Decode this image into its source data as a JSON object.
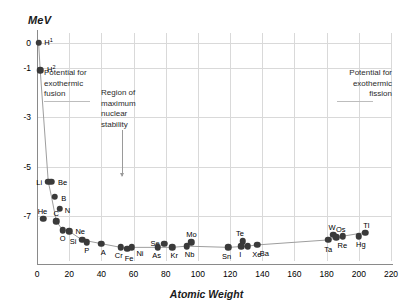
{
  "chart_data": {
    "type": "scatter",
    "title": "",
    "xlabel": "Atomic Weight",
    "ylabel": "MeV",
    "xlim": [
      0,
      220
    ],
    "ylim": [
      -8.8,
      0.4
    ],
    "grid": true,
    "legend": "none",
    "xticks": [
      0,
      20,
      40,
      60,
      80,
      100,
      120,
      140,
      160,
      180,
      200,
      220
    ],
    "yticks": [
      0,
      -1,
      -3,
      -5,
      -7
    ],
    "ytick_labels": [
      "0",
      "-1",
      "-3",
      "-5",
      "-7"
    ],
    "points": [
      {
        "label": "H",
        "sup": "1",
        "x": 1,
        "y": 0.0,
        "lx": 10,
        "ly": -1
      },
      {
        "label": "H",
        "sup": "2",
        "x": 2,
        "y": -1.1,
        "lx": 11,
        "ly": -1
      },
      {
        "label": "Li",
        "sup": "",
        "x": 7,
        "y": -5.6,
        "lx": -9,
        "ly": 0
      },
      {
        "label": "Be",
        "sup": "",
        "x": 9,
        "y": -5.6,
        "lx": 11,
        "ly": 0
      },
      {
        "label": "B",
        "sup": "",
        "x": 11,
        "y": -6.2,
        "lx": 9,
        "ly": 1
      },
      {
        "label": "He",
        "sup": "",
        "x": 4,
        "y": -7.1,
        "lx": -1,
        "ly": -8
      },
      {
        "label": "N",
        "sup": "",
        "x": 14,
        "y": -6.7,
        "lx": 8,
        "ly": 1
      },
      {
        "label": "C",
        "sup": "",
        "x": 12,
        "y": -7.2,
        "lx": 0,
        "ly": -8
      },
      {
        "label": "O",
        "sup": "",
        "x": 16,
        "y": -7.55,
        "lx": 0,
        "ly": 8
      },
      {
        "label": "Ne",
        "sup": "",
        "x": 20,
        "y": -7.6,
        "lx": 11,
        "ly": 0
      },
      {
        "label": "Si",
        "sup": "",
        "x": 28,
        "y": -7.95,
        "lx": -9,
        "ly": 1
      },
      {
        "label": "P",
        "sup": "",
        "x": 31,
        "y": -8.05,
        "lx": 0,
        "ly": 8
      },
      {
        "label": "A",
        "sup": "",
        "x": 40,
        "y": -8.1,
        "lx": 2,
        "ly": 8
      },
      {
        "label": "Cr",
        "sup": "",
        "x": 52,
        "y": -8.25,
        "lx": -2,
        "ly": 8
      },
      {
        "label": "Fe",
        "sup": "",
        "x": 56,
        "y": -8.3,
        "lx": 2,
        "ly": 9
      },
      {
        "label": "Ni",
        "sup": "",
        "x": 59,
        "y": -8.25,
        "lx": 8,
        "ly": 6
      },
      {
        "label": "Se",
        "sup": "",
        "x": 79,
        "y": -8.1,
        "lx": -9,
        "ly": -1
      },
      {
        "label": "As",
        "sup": "",
        "x": 75,
        "y": -8.25,
        "lx": -1,
        "ly": 8
      },
      {
        "label": "Kr",
        "sup": "",
        "x": 84,
        "y": -8.25,
        "lx": 2,
        "ly": 8
      },
      {
        "label": "Nb",
        "sup": "",
        "x": 93,
        "y": -8.2,
        "lx": 3,
        "ly": 8
      },
      {
        "label": "Mo",
        "sup": "",
        "x": 96,
        "y": -8.05,
        "lx": 0,
        "ly": -8
      },
      {
        "label": "Sn",
        "sup": "",
        "x": 119,
        "y": -8.25,
        "lx": -2,
        "ly": 9
      },
      {
        "label": "Te",
        "sup": "",
        "x": 128,
        "y": -8.0,
        "lx": -3,
        "ly": -8
      },
      {
        "label": "I",
        "sup": "",
        "x": 127,
        "y": -8.2,
        "lx": -1,
        "ly": 8
      },
      {
        "label": "Xe",
        "sup": "",
        "x": 131,
        "y": -8.2,
        "lx": 9,
        "ly": 8
      },
      {
        "label": "Ba",
        "sup": "",
        "x": 137,
        "y": -8.15,
        "lx": 7,
        "ly": 8
      },
      {
        "label": "Ta",
        "sup": "",
        "x": 181,
        "y": -7.95,
        "lx": 0,
        "ly": 9
      },
      {
        "label": "W",
        "sup": "",
        "x": 184,
        "y": -7.75,
        "lx": -1,
        "ly": -8
      },
      {
        "label": "Re",
        "sup": "",
        "x": 186,
        "y": -7.85,
        "lx": 6,
        "ly": 8
      },
      {
        "label": "Os",
        "sup": "",
        "x": 190,
        "y": -7.8,
        "lx": -2,
        "ly": -7
      },
      {
        "label": "Hg",
        "sup": "",
        "x": 200,
        "y": -7.8,
        "lx": 2,
        "ly": 8
      },
      {
        "label": "Tl",
        "sup": "",
        "x": 204,
        "y": -7.65,
        "lx": 1,
        "ly": -8
      }
    ],
    "curve_x": [
      1,
      2,
      7,
      9,
      12,
      16,
      20,
      28,
      40,
      52,
      56,
      59,
      75,
      84,
      93,
      119,
      131,
      137,
      181,
      190,
      204
    ],
    "curve_y": [
      0.0,
      -1.1,
      -5.6,
      -6.2,
      -7.2,
      -7.55,
      -7.6,
      -7.95,
      -8.1,
      -8.25,
      -8.3,
      -8.25,
      -8.25,
      -8.25,
      -8.2,
      -8.25,
      -8.2,
      -8.15,
      -7.95,
      -7.8,
      -7.65
    ],
    "annotations": [
      {
        "name": "fusion",
        "text": "Potential for exothermic fusion"
      },
      {
        "name": "stability",
        "text": "Region of maximum nuclear stability"
      },
      {
        "name": "fission",
        "text": "Potential for exothermic fission"
      }
    ],
    "colors": {
      "point": "#3a3a3a",
      "curve": "#9e9e9e",
      "grid": "#d9d9d9",
      "axis": "#8a8a8a",
      "text": "#000000"
    }
  },
  "annotations": {
    "fusion_line1": "Potential for",
    "fusion_line2": "exothermic",
    "fusion_line3": "fusion",
    "fission_line1": "Potential for",
    "fission_line2": "exothermic",
    "fission_line3": "fission",
    "stability_line1": "Region of",
    "stability_line2": "maximum",
    "stability_line3": "nuclear",
    "stability_line4": "stability"
  },
  "axes": {
    "x_title": "Atomic Weight",
    "y_title": "MeV"
  }
}
